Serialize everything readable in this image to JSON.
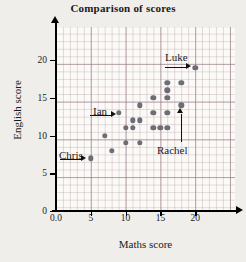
{
  "chart_data": {
    "type": "scatter",
    "title": "Comparison of scores",
    "xlabel": "Maths score",
    "ylabel": "English score",
    "xlim": [
      0,
      24
    ],
    "ylim": [
      0,
      23
    ],
    "xticks": [
      "0.0",
      "5",
      "10",
      "15",
      "20"
    ],
    "xtick_values": [
      0,
      5,
      10,
      15,
      20
    ],
    "yticks": [
      "0",
      "5",
      "10",
      "15",
      "20"
    ],
    "ytick_values": [
      0,
      5,
      10,
      15,
      20
    ],
    "grid": true,
    "legend": "none",
    "marker_color": "#6d6d75",
    "points": [
      {
        "x": 5,
        "y": 7
      },
      {
        "x": 7,
        "y": 10
      },
      {
        "x": 8,
        "y": 8
      },
      {
        "x": 9,
        "y": 13
      },
      {
        "x": 10,
        "y": 9
      },
      {
        "x": 10,
        "y": 11
      },
      {
        "x": 11,
        "y": 11
      },
      {
        "x": 11,
        "y": 12
      },
      {
        "x": 12,
        "y": 9
      },
      {
        "x": 12,
        "y": 12
      },
      {
        "x": 12,
        "y": 14
      },
      {
        "x": 14,
        "y": 11
      },
      {
        "x": 14,
        "y": 13
      },
      {
        "x": 14,
        "y": 15
      },
      {
        "x": 15,
        "y": 11
      },
      {
        "x": 16,
        "y": 11
      },
      {
        "x": 16,
        "y": 13
      },
      {
        "x": 16,
        "y": 15
      },
      {
        "x": 16,
        "y": 16
      },
      {
        "x": 16,
        "y": 17
      },
      {
        "x": 18,
        "y": 14
      },
      {
        "x": 18,
        "y": 17
      },
      {
        "x": 20,
        "y": 19
      }
    ],
    "annotations": [
      {
        "label": "Chris",
        "point": {
          "x": 5,
          "y": 7
        },
        "direction": "right"
      },
      {
        "label": "Ian",
        "point": {
          "x": 9,
          "y": 13
        },
        "direction": "right"
      },
      {
        "label": "Luke",
        "point": {
          "x": 20,
          "y": 19
        },
        "direction": "right"
      },
      {
        "label": "Rachel",
        "point": {
          "x": 18,
          "y": 14
        },
        "direction": "up"
      }
    ]
  }
}
